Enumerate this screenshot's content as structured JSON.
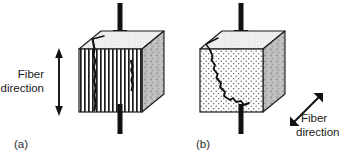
{
  "figure": {
    "background_color": "#ffffff",
    "line_color": "#1a1a1a",
    "fiber_color": "#1a1a1a",
    "matrix_fill": "#ffffff",
    "side_face_color": "#b8b8b8",
    "top_face_color": "#f2f2f2",
    "crack_color": "#111111"
  },
  "panels": [
    {
      "id": "a",
      "label": "(a)",
      "caption_label": "(a)",
      "fiber_direction": {
        "label_line1": "Fiber",
        "label_line2": "direction",
        "orientation": "vertical",
        "arrow_type": "double-headed",
        "angle_degrees": 90
      },
      "load": {
        "type": "compression",
        "orientation": "vertical",
        "arrow_type": "single-headed-down"
      },
      "front_face_pattern": "vertical-fiber-stripes",
      "top_face_pattern": "stipple",
      "side_face_pattern": "mottled-gray",
      "failure": {
        "mode": "longitudinal-splitting",
        "crack_count": 2,
        "crack_orientation": "parallel-to-fibers"
      }
    },
    {
      "id": "b",
      "label": "(b)",
      "caption_label": "(b)",
      "fiber_direction": {
        "label_line1": "Fiber",
        "label_line2": "direction",
        "orientation": "diagonal",
        "arrow_type": "double-headed",
        "angle_degrees": 45
      },
      "load": {
        "type": "compression",
        "orientation": "vertical",
        "arrow_type": "single-headed-down"
      },
      "front_face_pattern": "uniform-dot-stipple",
      "top_face_pattern": "stipple",
      "side_face_pattern": "mottled-gray",
      "failure": {
        "mode": "transverse-shear-crack",
        "crack_count": 1,
        "crack_orientation": "diagonal"
      }
    }
  ]
}
